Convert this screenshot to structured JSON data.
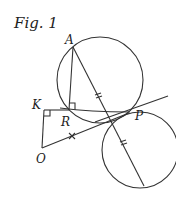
{
  "figure": {
    "title": "Fig. 1",
    "points": {
      "A": "A",
      "K": "K",
      "R": "R",
      "P": "P",
      "O": "O"
    },
    "annotations": {
      "equal_marks_AP_PB": "double tick (=)",
      "mark_OP": "× mark",
      "right_angle_R": "right angle at R",
      "right_angle_K": "right angle at K"
    },
    "colors": {
      "stroke": "#333333",
      "background": "#ffffff"
    }
  }
}
